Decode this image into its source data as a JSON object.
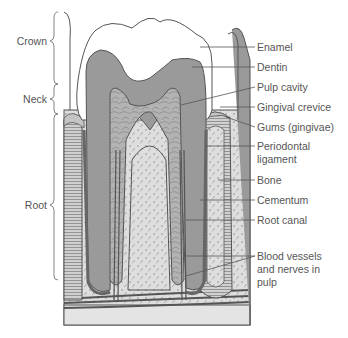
{
  "diagram": {
    "colors": {
      "background": "#ffffff",
      "enamel": "#ffffff",
      "dentin": "#9a9a9a",
      "pulp": "#b5b5b5",
      "bone": "#dedede",
      "gums": "#c4c4c4",
      "line": "#444444",
      "label_text": "#555555"
    },
    "left_labels": [
      {
        "id": "crown",
        "text": "Crown"
      },
      {
        "id": "neck",
        "text": "Neck"
      },
      {
        "id": "root",
        "text": "Root"
      }
    ],
    "right_labels": [
      {
        "id": "enamel",
        "text": "Enamel"
      },
      {
        "id": "dentin",
        "text": "Dentin"
      },
      {
        "id": "pulp-cavity",
        "text": "Pulp cavity"
      },
      {
        "id": "gingival-crevice",
        "text": "Gingival crevice"
      },
      {
        "id": "gums",
        "text": "Gums (gingivae)"
      },
      {
        "id": "periodontal-ligament",
        "text": "Periodontal\nligament"
      },
      {
        "id": "bone",
        "text": "Bone"
      },
      {
        "id": "cementum",
        "text": "Cementum"
      },
      {
        "id": "root-canal",
        "text": "Root canal"
      },
      {
        "id": "blood-vessels",
        "text": "Blood vessels\nand nerves in\npulp"
      }
    ]
  }
}
